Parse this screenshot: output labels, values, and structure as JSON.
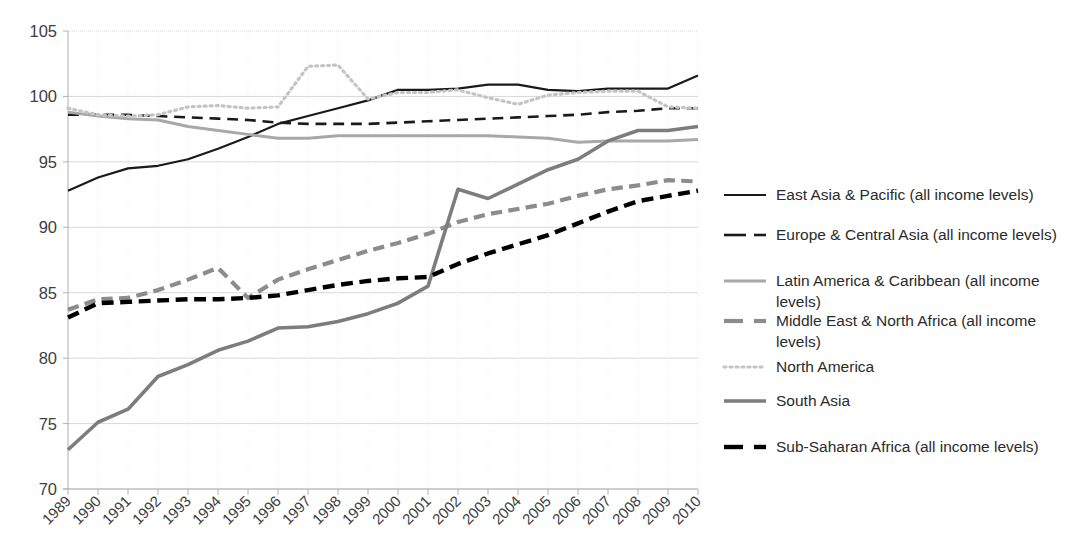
{
  "chart_data": {
    "type": "line",
    "title": "",
    "xlabel": "",
    "ylabel": "",
    "ylim": [
      70,
      105
    ],
    "ytick_step": 5,
    "ytick_labels": [
      "105",
      "100",
      "95",
      "90",
      "85",
      "80",
      "75",
      "70"
    ],
    "grid": "horizontal-and-vertical-dotted",
    "legend_position": "right",
    "x": [
      1989,
      1990,
      1991,
      1992,
      1993,
      1994,
      1995,
      1996,
      1997,
      1998,
      1999,
      2000,
      2001,
      2002,
      2003,
      2004,
      2005,
      2006,
      2007,
      2008,
      2009,
      2010
    ],
    "xtick_labels": [
      "1989",
      "1990",
      "1991",
      "1992",
      "1993",
      "1994",
      "1995",
      "1996",
      "1997",
      "1998",
      "1999",
      "2000",
      "2001",
      "2002",
      "2003",
      "2004",
      "2005",
      "2006",
      "2007",
      "2008",
      "2009",
      "2010"
    ],
    "series": [
      {
        "name": "East Asia & Pacific (all income levels)",
        "style": "solid",
        "color": "#1a1a1a",
        "width": 2.2,
        "values": [
          92.8,
          93.8,
          94.5,
          94.7,
          95.2,
          96.0,
          96.9,
          97.9,
          98.5,
          99.1,
          99.7,
          100.5,
          100.5,
          100.6,
          100.9,
          100.9,
          100.5,
          100.4,
          100.6,
          100.6,
          100.6,
          101.6
        ]
      },
      {
        "name": "Europe & Central Asia (all income levels)",
        "style": "dashed",
        "color": "#1a1a1a",
        "width": 2.6,
        "values": [
          98.6,
          98.6,
          98.6,
          98.5,
          98.4,
          98.3,
          98.2,
          98.0,
          97.9,
          97.9,
          97.9,
          98.0,
          98.1,
          98.2,
          98.3,
          98.4,
          98.5,
          98.6,
          98.8,
          98.9,
          99.1,
          99.1
        ]
      },
      {
        "name": "Latin America & Caribbean (all income levels)",
        "style": "solid",
        "color": "#a8a8a8",
        "width": 3.0,
        "values": [
          98.8,
          98.5,
          98.3,
          98.2,
          97.7,
          97.4,
          97.1,
          96.8,
          96.8,
          97.0,
          97.0,
          97.0,
          97.0,
          97.0,
          97.0,
          96.9,
          96.8,
          96.5,
          96.6,
          96.6,
          96.6,
          96.7
        ]
      },
      {
        "name": "Middle East & North Africa (all income levels)",
        "style": "dashed-thick",
        "color": "#8c8c8c",
        "width": 4.2,
        "values": [
          83.7,
          84.5,
          84.6,
          85.2,
          86.0,
          86.9,
          84.6,
          86.0,
          86.8,
          87.5,
          88.2,
          88.8,
          89.5,
          90.4,
          91.0,
          91.4,
          91.8,
          92.4,
          92.9,
          93.2,
          93.6,
          93.5
        ]
      },
      {
        "name": "North America",
        "style": "dotted",
        "color": "#c4c4c4",
        "width": 3.2,
        "values": [
          99.1,
          98.6,
          98.5,
          98.6,
          99.2,
          99.3,
          99.1,
          99.2,
          102.3,
          102.4,
          99.8,
          100.3,
          100.3,
          100.5,
          99.9,
          99.4,
          100.1,
          100.3,
          100.4,
          100.4,
          99.2,
          99.1
        ]
      },
      {
        "name": "South Asia",
        "style": "solid",
        "color": "#7d7d7d",
        "width": 3.6,
        "values": [
          73.0,
          75.1,
          76.1,
          78.6,
          79.5,
          80.6,
          81.3,
          82.3,
          82.4,
          82.8,
          83.4,
          84.2,
          85.5,
          92.9,
          92.2,
          93.3,
          94.4,
          95.2,
          96.6,
          97.4,
          97.4,
          97.7
        ]
      },
      {
        "name": "Sub-Saharan Africa (all income levels)",
        "style": "dashed-thick",
        "color": "#000000",
        "width": 4.4,
        "values": [
          83.1,
          84.2,
          84.3,
          84.4,
          84.5,
          84.5,
          84.6,
          84.8,
          85.2,
          85.6,
          85.9,
          86.1,
          86.2,
          87.2,
          88.0,
          88.7,
          89.4,
          90.3,
          91.2,
          92.0,
          92.4,
          92.8
        ]
      }
    ]
  },
  "axis": {
    "y_label_color": "#404040",
    "x_label_color": "#404040",
    "gridline_color": "#d9d9d9",
    "axis_line_color": "#b0b0b0"
  },
  "legend": {
    "items": [
      {
        "label": "East Asia & Pacific (all income levels)",
        "swatch": "line-solid-dark"
      },
      {
        "label": "Europe & Central Asia (all income levels)",
        "swatch": "line-dashed-dark"
      },
      {
        "label": "Latin America & Caribbean (all income levels)",
        "swatch": "line-solid-light"
      },
      {
        "label": "Middle East & North Africa (all income levels)",
        "swatch": "line-dashed-gray"
      },
      {
        "label": "North America",
        "swatch": "line-dotted-light"
      },
      {
        "label": "South Asia",
        "swatch": "line-solid-gray"
      },
      {
        "label": "Sub-Saharan Africa (all income levels)",
        "swatch": "line-dashed-black"
      }
    ]
  }
}
